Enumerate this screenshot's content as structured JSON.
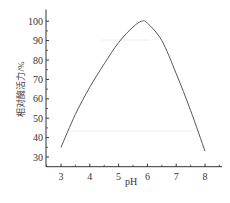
{
  "chart_data": {
    "type": "line",
    "title": "",
    "xlabel": "pH",
    "ylabel": "相对酶活力/%",
    "xlim": [
      2.5,
      8.5
    ],
    "ylim": [
      25,
      105
    ],
    "xticks": [
      3,
      4,
      5,
      6,
      7,
      8
    ],
    "yticks": [
      30,
      40,
      50,
      60,
      70,
      80,
      90,
      100
    ],
    "grid": false,
    "legend": null,
    "series": [
      {
        "name": "相对酶活力",
        "color": "#555555",
        "x": [
          3.0,
          3.5,
          4.0,
          4.5,
          5.0,
          5.5,
          5.8,
          6.0,
          6.5,
          7.0,
          7.5,
          8.0
        ],
        "y": [
          35,
          52,
          66,
          78,
          89,
          97,
          100,
          99,
          90,
          73,
          54,
          33
        ]
      }
    ]
  }
}
